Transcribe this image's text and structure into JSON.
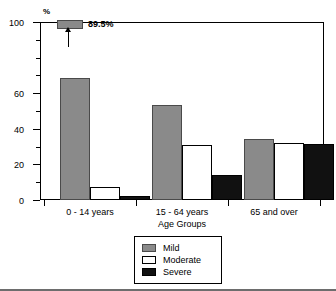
{
  "chart_data": {
    "type": "bar",
    "title": "",
    "xlabel": "Age Groups",
    "ylabel": "%",
    "ylim": [
      0,
      100
    ],
    "yticks": [
      0,
      20,
      40,
      60,
      100
    ],
    "ytick_labels": [
      "0",
      "20",
      "40",
      "60",
      "100"
    ],
    "yminor_step": 10,
    "grid": false,
    "legend_position": "bottom-center",
    "categories": [
      "0 - 14 years",
      "15 - 64 years",
      "65 and over"
    ],
    "series": [
      {
        "name": "Mild",
        "color": "#8a8a8a",
        "values": [
          68.5,
          53.5,
          34.5
        ],
        "display_values": [
          89.5,
          53.5,
          34.5
        ]
      },
      {
        "name": "Moderate",
        "color": "#ffffff",
        "values": [
          7.5,
          31.0,
          32.0
        ]
      },
      {
        "name": "Severe",
        "color": "#111111",
        "values": [
          2.5,
          14.0,
          31.5
        ]
      }
    ],
    "annotations": [
      {
        "name": "truncated-bar-callout",
        "label": "89.5%",
        "series": "Mild",
        "category": "0 - 14 years",
        "value": 89.5,
        "note": "first Mild bar is clipped; true value shown by callout at top of axis"
      }
    ]
  },
  "axis": {
    "y_unit": "%",
    "ticks": [
      {
        "value": 100,
        "label": "100",
        "major": true
      },
      {
        "value": 90,
        "label": "",
        "major": false
      },
      {
        "value": 80,
        "label": "",
        "major": false
      },
      {
        "value": 70,
        "label": "",
        "major": false
      },
      {
        "value": 60,
        "label": "60",
        "major": true
      },
      {
        "value": 50,
        "label": "",
        "major": false
      },
      {
        "value": 40,
        "label": "40",
        "major": true
      },
      {
        "value": 30,
        "label": "",
        "major": false
      },
      {
        "value": 20,
        "label": "20",
        "major": true
      },
      {
        "value": 10,
        "label": "",
        "major": false
      },
      {
        "value": 0,
        "label": "0",
        "major": true
      }
    ],
    "x_title": "Age Groups"
  },
  "legend": {
    "items": [
      {
        "label": "Mild",
        "swatch": "mild"
      },
      {
        "label": "Moderate",
        "swatch": "moderate"
      },
      {
        "label": "Severe",
        "swatch": "severe"
      }
    ]
  },
  "callout": {
    "label": "89.5%"
  }
}
